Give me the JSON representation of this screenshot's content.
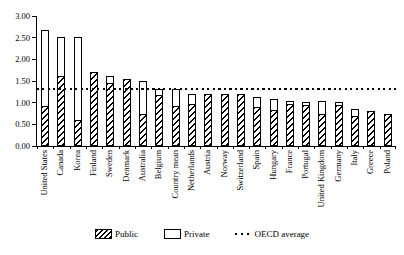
{
  "chart_data": {
    "type": "bar",
    "stacked": true,
    "title": "",
    "xlabel": "",
    "ylabel": "",
    "categories": [
      "United States",
      "Canada",
      "Korea",
      "Finland",
      "Sweden",
      "Denmark",
      "Australia",
      "Belgium",
      "Country mean",
      "Netherlands",
      "Austria",
      "Norway",
      "Switzerland",
      "Spain",
      "Hungary",
      "France",
      "Portugal",
      "United Kingdom",
      "Germany",
      "Italy",
      "Greece",
      "Poland"
    ],
    "series": [
      {
        "name": "Public",
        "fill": "diagonal-hatch",
        "values": [
          0.92,
          1.62,
          0.6,
          1.72,
          1.45,
          1.55,
          0.75,
          1.18,
          0.92,
          0.97,
          1.2,
          1.2,
          1.19,
          0.9,
          0.83,
          0.96,
          0.94,
          0.73,
          0.95,
          0.7,
          0.82,
          0.73
        ]
      },
      {
        "name": "Private",
        "fill": "white",
        "values": [
          1.78,
          0.93,
          1.94,
          0.0,
          0.2,
          0.0,
          0.78,
          0.16,
          0.42,
          0.25,
          0.0,
          0.0,
          0.0,
          0.26,
          0.28,
          0.1,
          0.09,
          0.33,
          0.08,
          0.17,
          0.0,
          0.0
        ]
      }
    ],
    "reference_line": {
      "label": "OECD average",
      "value": 1.32,
      "style": "dotted"
    },
    "ylim": [
      0,
      3
    ],
    "ytick_step": 0.5,
    "ytick_labels": [
      "0.00",
      "0.50",
      "1.00",
      "1.50",
      "2.00",
      "2.50",
      "3.00"
    ],
    "grid": false,
    "legend_position": "bottom"
  },
  "colors": {
    "foreground": "#000000",
    "background": "#ffffff",
    "hatch": "#000000",
    "bar_fill": "#ffffff"
  }
}
